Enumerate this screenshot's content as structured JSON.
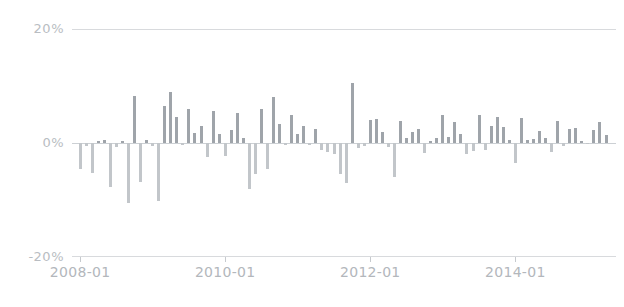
{
  "chart_data": {
    "type": "bar",
    "title": "",
    "subtitle": "",
    "xlabel": "",
    "ylabel": "",
    "ylim": [
      -20,
      20
    ],
    "yticks": [
      20,
      0,
      -20
    ],
    "ytick_labels": [
      "20%",
      "0%",
      "-20%"
    ],
    "xticks": [
      "2008-01",
      "2010-01",
      "2012-01",
      "2014-01"
    ],
    "grid": true,
    "legend": null,
    "legend_position": "none",
    "axis_color": "#d8dadd",
    "bar_color_positive": "#9fa4aa",
    "bar_color_negative": "#c2c6ca",
    "x_start": "2008-01",
    "x_end": "2015-04",
    "x_freq": "monthly",
    "categories": [
      "2008-01",
      "2008-02",
      "2008-03",
      "2008-04",
      "2008-05",
      "2008-06",
      "2008-07",
      "2008-08",
      "2008-09",
      "2008-10",
      "2008-11",
      "2008-12",
      "2009-01",
      "2009-02",
      "2009-03",
      "2009-04",
      "2009-05",
      "2009-06",
      "2009-07",
      "2009-08",
      "2009-09",
      "2009-10",
      "2009-11",
      "2009-12",
      "2010-01",
      "2010-02",
      "2010-03",
      "2010-04",
      "2010-05",
      "2010-06",
      "2010-07",
      "2010-08",
      "2010-09",
      "2010-10",
      "2010-11",
      "2010-12",
      "2011-01",
      "2011-02",
      "2011-03",
      "2011-04",
      "2011-05",
      "2011-06",
      "2011-07",
      "2011-08",
      "2011-09",
      "2011-10",
      "2011-11",
      "2011-12",
      "2012-01",
      "2012-02",
      "2012-03",
      "2012-04",
      "2012-05",
      "2012-06",
      "2012-07",
      "2012-08",
      "2012-09",
      "2012-10",
      "2012-11",
      "2012-12",
      "2013-01",
      "2013-02",
      "2013-03",
      "2013-04",
      "2013-05",
      "2013-06",
      "2013-07",
      "2013-08",
      "2013-09",
      "2013-10",
      "2013-11",
      "2013-12",
      "2014-01",
      "2014-02",
      "2014-03",
      "2014-04",
      "2014-05",
      "2014-06",
      "2014-07",
      "2014-08",
      "2014-09",
      "2014-10",
      "2014-11",
      "2014-12",
      "2015-01",
      "2015-02",
      "2015-03",
      "2015-04"
    ],
    "values": [
      -4.5,
      -0.6,
      -5.2,
      0.4,
      0.5,
      -7.8,
      -0.7,
      0.3,
      -10.5,
      8.2,
      -6.8,
      0.6,
      -0.5,
      -10.2,
      6.5,
      9.0,
      4.5,
      -0.4,
      6.0,
      1.8,
      3.0,
      -2.5,
      5.7,
      1.5,
      -2.2,
      2.3,
      5.2,
      0.9,
      -8.0,
      -5.5,
      6.0,
      -4.5,
      8.0,
      3.4,
      -0.3,
      5.0,
      1.6,
      3.0,
      -0.4,
      2.5,
      -1.2,
      -1.6,
      -2.0,
      -5.5,
      -7.0,
      10.5,
      -0.8,
      -0.6,
      4.0,
      4.2,
      2.0,
      -0.7,
      -6.0,
      3.8,
      0.8,
      1.9,
      2.4,
      -1.8,
      0.3,
      0.9,
      5.0,
      1.1,
      3.6,
      1.6,
      -2.0,
      -1.4,
      5.0,
      -1.2,
      3.0,
      4.5,
      2.8,
      0.6,
      -3.5,
      4.3,
      0.6,
      0.7,
      2.1,
      0.9,
      -1.5,
      3.9,
      -0.5,
      2.4,
      2.6,
      0.4,
      -0.2,
      2.2,
      3.6,
      1.4
    ]
  }
}
